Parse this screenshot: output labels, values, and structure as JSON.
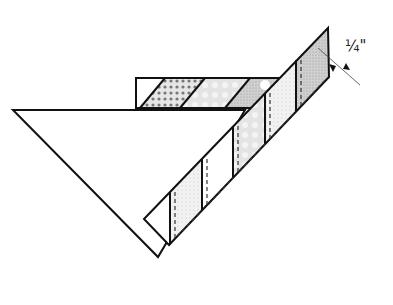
{
  "diagram": {
    "type": "quilting-assembly-diagram",
    "seam_allowance_label": "1/4\"",
    "seam_allowance_display": "¼\"",
    "colors": {
      "outline": "#111111",
      "fabric_light": "#f0f0f0",
      "fabric_medium": "#d6d6d6",
      "fabric_dark": "#bdbdbd",
      "background": "#ffffff"
    },
    "parts": [
      {
        "name": "large-triangle",
        "description": "Large half-square triangle"
      },
      {
        "name": "horizontal-pieced-strip",
        "segments": 5
      },
      {
        "name": "diagonal-pieced-strip",
        "segments": 6,
        "stitch_lines": "dashed"
      }
    ]
  }
}
